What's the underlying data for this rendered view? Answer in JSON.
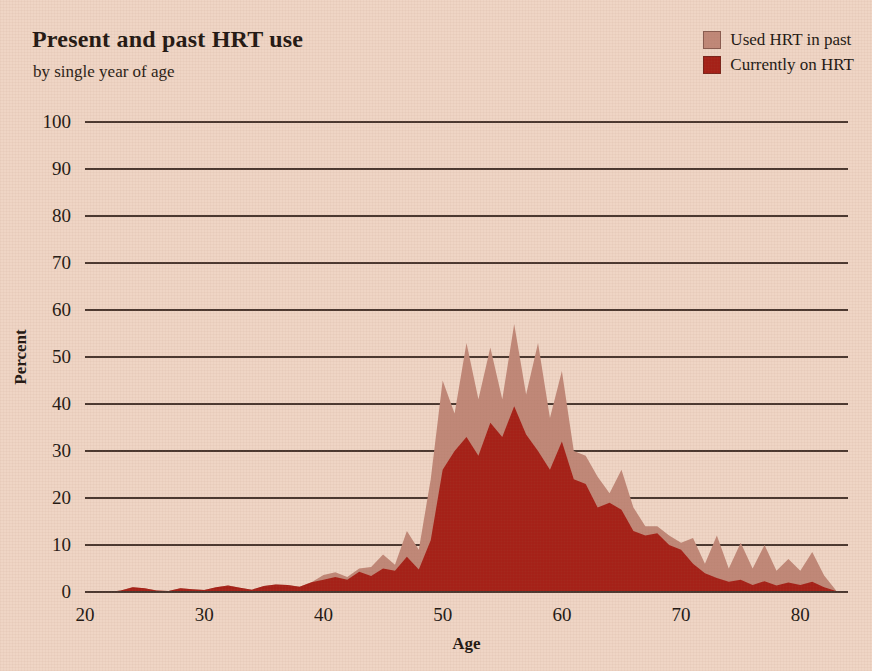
{
  "chart_data": {
    "type": "area",
    "title": "Present and past HRT use",
    "subtitle": "by single year of age",
    "xlabel": "Age",
    "ylabel": "Percent",
    "xlim": [
      20,
      84
    ],
    "ylim": [
      0,
      100
    ],
    "grid": true,
    "stacked": true,
    "legend_position": "top-right",
    "xticks": [
      20,
      30,
      40,
      50,
      60,
      70,
      80
    ],
    "yticks": [
      0,
      10,
      20,
      30,
      40,
      50,
      60,
      70,
      80,
      90,
      100
    ],
    "colors": {
      "used_past": "#c08878",
      "current": "#a52118",
      "background": "#efd5c5",
      "gridline": "#4a3830",
      "text": "#231914"
    },
    "x": [
      20,
      21,
      22,
      23,
      24,
      25,
      26,
      27,
      28,
      29,
      30,
      31,
      32,
      33,
      34,
      35,
      36,
      37,
      38,
      39,
      40,
      41,
      42,
      43,
      44,
      45,
      46,
      47,
      48,
      49,
      50,
      51,
      52,
      53,
      54,
      55,
      56,
      57,
      58,
      59,
      60,
      61,
      62,
      63,
      64,
      65,
      66,
      67,
      68,
      69,
      70,
      71,
      72,
      73,
      74,
      75,
      76,
      77,
      78,
      79,
      80,
      81,
      82,
      83
    ],
    "series": [
      {
        "name": "Currently on HRT",
        "color": "#a52118",
        "values": [
          0,
          0,
          0,
          0.3,
          1.0,
          0.8,
          0.3,
          0.2,
          0.8,
          0.6,
          0.4,
          1.0,
          1.4,
          0.9,
          0.5,
          1.3,
          1.6,
          1.5,
          1.1,
          2.1,
          2.6,
          3.2,
          2.6,
          4.3,
          3.4,
          5.0,
          4.5,
          7.5,
          4.8,
          11.0,
          26.0,
          30.0,
          33.0,
          29.0,
          36.0,
          33.0,
          39.5,
          33.5,
          30.0,
          26.0,
          32.0,
          24.0,
          23.0,
          18.0,
          19.0,
          17.5,
          13.0,
          12.0,
          12.5,
          10.0,
          9.0,
          6.0,
          4.0,
          3.0,
          2.2,
          2.6,
          1.5,
          2.3,
          1.4,
          2.0,
          1.5,
          2.2,
          1.0,
          0.2
        ]
      },
      {
        "name": "Used HRT in past",
        "color": "#c08878",
        "values": [
          0,
          0,
          0,
          0.3,
          1.0,
          0.8,
          0.3,
          0.2,
          0.8,
          0.6,
          0.4,
          1.0,
          1.4,
          0.9,
          0.5,
          1.3,
          1.6,
          1.5,
          1.1,
          2.1,
          3.6,
          4.2,
          3.2,
          5.0,
          5.3,
          8.0,
          5.8,
          13.0,
          9.0,
          24.0,
          45.0,
          38.0,
          53.0,
          41.0,
          52.0,
          41.0,
          57.0,
          42.0,
          53.0,
          37.0,
          47.0,
          30.0,
          29.0,
          24.5,
          21.0,
          26.0,
          18.0,
          14.0,
          14.0,
          12.0,
          10.5,
          11.5,
          6.0,
          12.0,
          5.0,
          10.5,
          5.0,
          10.0,
          4.5,
          7.0,
          4.5,
          8.5,
          3.5,
          0.3
        ]
      }
    ],
    "legend": [
      {
        "label": "Used HRT in past",
        "color": "#c08878"
      },
      {
        "label": "Currently on HRT",
        "color": "#a52118"
      }
    ]
  }
}
